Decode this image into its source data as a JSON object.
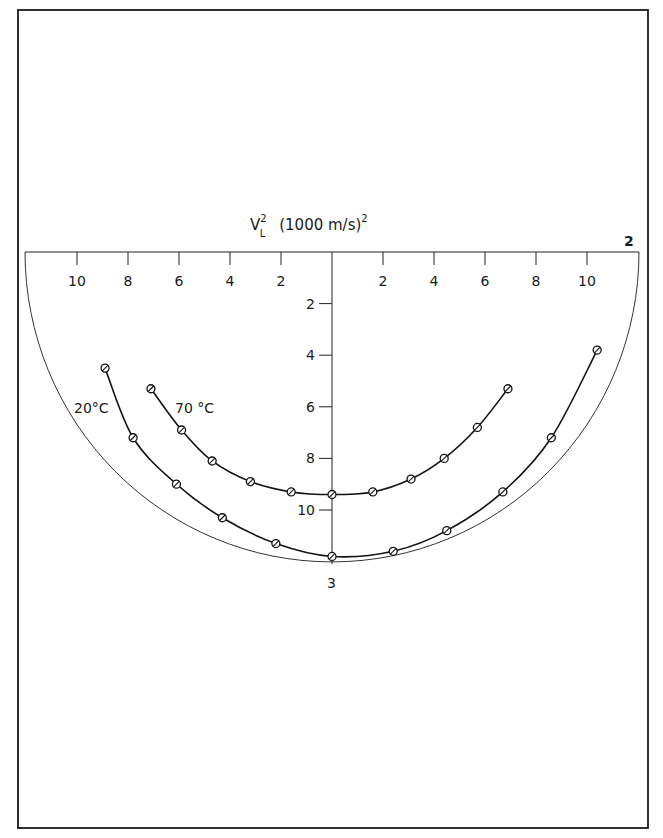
{
  "chart_data": {
    "type": "line",
    "title_parts": {
      "symbol": "V",
      "subscript": "L",
      "superscript": "2",
      "unit": "(1000 m/s)",
      "unit_superscript": "2"
    },
    "xlabel": "V_L² (1000 m/s)²",
    "ylabel": "",
    "xlim": [
      -12,
      12
    ],
    "ylim": [
      0,
      12
    ],
    "x_ticks_left": [
      10,
      8,
      6,
      4,
      2
    ],
    "x_ticks_right": [
      2,
      4,
      6,
      8,
      10
    ],
    "y_ticks": [
      2,
      4,
      6,
      8,
      10
    ],
    "corner_label_top_right": "2",
    "bottom_label": "3",
    "grid": false,
    "legend": "inline labels near curves (left)",
    "series": [
      {
        "name": "20°C",
        "label": "20°C",
        "points": [
          [
            -8.9,
            4.5
          ],
          [
            -7.8,
            7.2
          ],
          [
            -6.1,
            9.0
          ],
          [
            -4.3,
            10.3
          ],
          [
            -2.2,
            11.3
          ],
          [
            0,
            11.8
          ],
          [
            2.4,
            11.6
          ],
          [
            4.5,
            10.8
          ],
          [
            6.7,
            9.3
          ],
          [
            8.6,
            7.2
          ],
          [
            10.4,
            3.8
          ]
        ]
      },
      {
        "name": "70°C",
        "label": "70 °C",
        "points": [
          [
            -7.1,
            5.3
          ],
          [
            -5.9,
            6.9
          ],
          [
            -4.7,
            8.1
          ],
          [
            -3.2,
            8.9
          ],
          [
            -1.6,
            9.3
          ],
          [
            0,
            9.4
          ],
          [
            1.6,
            9.3
          ],
          [
            3.1,
            8.8
          ],
          [
            4.4,
            8.0
          ],
          [
            5.7,
            6.8
          ],
          [
            6.9,
            5.3
          ]
        ]
      }
    ]
  }
}
